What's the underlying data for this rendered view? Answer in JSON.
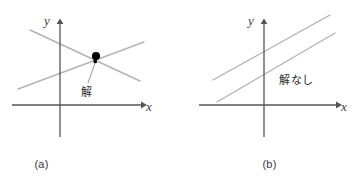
{
  "figure": {
    "panels": [
      {
        "id": "a",
        "caption": "(a)",
        "axes": {
          "x_label": "x",
          "y_label": "y",
          "origin": {
            "x": 60,
            "y": 105
          },
          "x_axis": {
            "x1": 12,
            "y1": 105,
            "x2": 145,
            "y2": 105
          },
          "y_axis": {
            "x1": 60,
            "y1": 20,
            "x2": 60,
            "y2": 137
          }
        },
        "annotation": "解",
        "lines": [
          {
            "name": "line-rising",
            "x1": 18,
            "y1": 89,
            "x2": 144,
            "y2": 42
          },
          {
            "name": "line-falling",
            "x1": 30,
            "y1": 30,
            "x2": 140,
            "y2": 81
          }
        ],
        "intersection": {
          "x": 96,
          "y": 56,
          "radius": 4
        },
        "leader": {
          "x1": 95,
          "y1": 63,
          "x2": 88,
          "y2": 84
        }
      },
      {
        "id": "b",
        "caption": "(b)",
        "axes": {
          "x_label": "x",
          "y_label": "y",
          "origin": {
            "x": 85,
            "y": 105
          },
          "x_axis": {
            "x1": 20,
            "y1": 105,
            "x2": 161,
            "y2": 105
          },
          "y_axis": {
            "x1": 85,
            "y1": 20,
            "x2": 85,
            "y2": 137
          }
        },
        "annotation": "解なし",
        "lines": [
          {
            "name": "line-upper",
            "x1": 34,
            "y1": 80,
            "x2": 151,
            "y2": 15
          },
          {
            "name": "line-lower",
            "x1": 38,
            "y1": 102,
            "x2": 156,
            "y2": 33
          }
        ]
      }
    ],
    "colors": {
      "axis": "#555555",
      "line": "#b3b3b3",
      "point": "#000000",
      "text": "#2b2b2b",
      "caption": "#3a3a3a",
      "background": "#ffffff"
    }
  }
}
